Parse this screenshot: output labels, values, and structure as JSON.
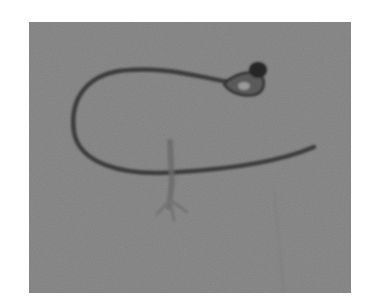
{
  "image": {
    "alt": "Grayscale photograph of a curved catheter tube with a balloon tip, lying on a textured gray fabric background",
    "subject": "catheter",
    "colors": {
      "page_background": "#ffffff",
      "photo_background": "#8a8a8a",
      "tube": "#3a3a3a",
      "tip": "#2a2a2a"
    }
  }
}
